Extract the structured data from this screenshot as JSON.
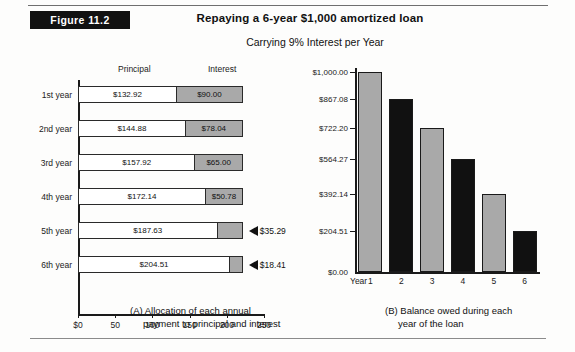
{
  "figure": {
    "badge": "Figure 11.2",
    "title": "Repaying a 6-year $1,000 amortized loan",
    "subtitle": "Carrying 9% Interest per Year"
  },
  "panel_a": {
    "caption_line1": "(A) Allocation of each annual",
    "caption_line2": "payment to principal and interest",
    "col_headers": {
      "principal": "Principal",
      "interest": "Interest"
    }
  },
  "panel_b": {
    "caption_line1": "(B) Balance owed during each",
    "caption_line2": "year of the loan",
    "axis_word": "Year"
  },
  "chart_data": [
    {
      "type": "bar",
      "orientation": "horizontal",
      "stacked": true,
      "title": "(A) Allocation of each annual payment to principal and interest",
      "xlabel": "",
      "ylabel": "",
      "xlim": [
        0,
        250
      ],
      "xticks": [
        0,
        50,
        100,
        150,
        200,
        250
      ],
      "xticklabels": [
        "$0",
        "50",
        "100",
        "150",
        "200",
        "250"
      ],
      "grid": false,
      "categories": [
        "1st year",
        "2nd year",
        "3rd year",
        "4th year",
        "5th year",
        "6th year"
      ],
      "series": [
        {
          "name": "Principal",
          "color": "#ffffff",
          "values": [
            132.92,
            144.88,
            157.92,
            172.14,
            187.63,
            204.51
          ],
          "labels": [
            "$132.92",
            "$144.88",
            "$157.92",
            "$172.14",
            "$187.63",
            "$204.51"
          ]
        },
        {
          "name": "Interest",
          "color": "#a9a9a9",
          "values": [
            90.0,
            78.04,
            65.0,
            50.78,
            35.29,
            18.41
          ],
          "labels": [
            "$90.00",
            "$78.04",
            "$65.00",
            "$50.78",
            "$35.29",
            "$18.41"
          ]
        }
      ],
      "annotations": [
        {
          "text": "$35.29",
          "row": "5th year",
          "note": "arrow callout"
        },
        {
          "text": "$18.41",
          "row": "6th year",
          "note": "arrow callout"
        }
      ]
    },
    {
      "type": "bar",
      "orientation": "vertical",
      "title": "(B) Balance owed during each year of the loan",
      "xlabel": "Year",
      "ylabel": "",
      "ylim": [
        0,
        1000
      ],
      "yticks": [
        0,
        204.51,
        392.14,
        564.27,
        722.2,
        867.08,
        1000.0
      ],
      "yticklabels": [
        "$0.00",
        "$204.51",
        "$392.14",
        "$564.27",
        "$722.20",
        "$867.08",
        "$1,000.00"
      ],
      "grid": false,
      "categories": [
        "1",
        "2",
        "3",
        "4",
        "5",
        "6"
      ],
      "values": [
        1000.0,
        867.08,
        722.2,
        564.27,
        392.14,
        204.51
      ],
      "colors": [
        "#a9a9a9",
        "#111111",
        "#a9a9a9",
        "#111111",
        "#a9a9a9",
        "#111111"
      ]
    }
  ]
}
